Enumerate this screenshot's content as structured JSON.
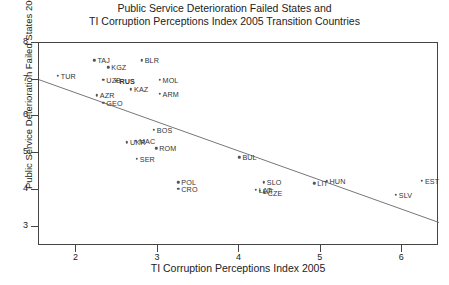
{
  "title": {
    "line1": "Public Service Deterioration Failed States  and",
    "line2": "TI Corruption Perceptions Index 2005 Transition Countries"
  },
  "axes": {
    "xlabel": "TI Corruption Perceptions Index 2005",
    "ylabel": "Public Service Deterioration Failed States 2006",
    "xticks": [
      "2",
      "3",
      "4",
      "5",
      "6"
    ],
    "yticks": [
      "8",
      "7",
      "6",
      "5",
      "4",
      "3"
    ]
  },
  "chart_data": {
    "type": "scatter",
    "title": "Public Service Deterioration Failed States  and TI Corruption Perceptions Index 2005 Transition Countries",
    "xlabel": "TI Corruption Perceptions Index 2005",
    "ylabel": "Public Service Deterioration Failed States 2006",
    "xlim": [
      1.54,
      6.45
    ],
    "ylim": [
      2.47,
      8.0
    ],
    "grid": false,
    "legend": null,
    "xticks": [
      2,
      3,
      4,
      5,
      6
    ],
    "yticks": [
      3,
      4,
      5,
      6,
      7,
      8
    ],
    "points": [
      {
        "label": "TUR",
        "x": 1.77,
        "y": 7.11,
        "label_pos": "right"
      },
      {
        "label": "TAJ",
        "x": 2.22,
        "y": 7.53,
        "label_pos": "right"
      },
      {
        "label": "KGZ",
        "x": 2.39,
        "y": 7.34,
        "label_pos": "right"
      },
      {
        "label": "BLR",
        "x": 2.8,
        "y": 7.53,
        "label_pos": "right"
      },
      {
        "label": "UZB",
        "x": 2.33,
        "y": 7.0,
        "label_pos": "right"
      },
      {
        "label": "RUS",
        "x": 2.49,
        "y": 6.97,
        "label_pos": "right",
        "bold": true
      },
      {
        "label": "MOL",
        "x": 3.02,
        "y": 7.0,
        "label_pos": "right"
      },
      {
        "label": "KAZ",
        "x": 2.67,
        "y": 6.74,
        "label_pos": "right"
      },
      {
        "label": "ARM",
        "x": 3.02,
        "y": 6.61,
        "label_pos": "right"
      },
      {
        "label": "AZR",
        "x": 2.25,
        "y": 6.58,
        "label_pos": "right"
      },
      {
        "label": "GEO",
        "x": 2.33,
        "y": 6.37,
        "label_pos": "right"
      },
      {
        "label": "BOS",
        "x": 2.95,
        "y": 5.63,
        "label_pos": "right"
      },
      {
        "label": "MAC",
        "x": 2.73,
        "y": 5.34,
        "label_pos": "right"
      },
      {
        "label": "UKR",
        "x": 2.62,
        "y": 5.29,
        "label_pos": "right"
      },
      {
        "label": "ROM",
        "x": 2.98,
        "y": 5.13,
        "label_pos": "right"
      },
      {
        "label": "SER",
        "x": 2.74,
        "y": 4.84,
        "label_pos": "right"
      },
      {
        "label": "BUL",
        "x": 4.0,
        "y": 4.89,
        "label_pos": "right"
      },
      {
        "label": "POL",
        "x": 3.25,
        "y": 4.21,
        "label_pos": "right"
      },
      {
        "label": "CRO",
        "x": 3.25,
        "y": 4.03,
        "label_pos": "right"
      },
      {
        "label": "SLO",
        "x": 4.3,
        "y": 4.21,
        "label_pos": "right"
      },
      {
        "label": "LAT",
        "x": 4.2,
        "y": 4.0,
        "label_pos": "right"
      },
      {
        "label": "LIT",
        "x": 4.25,
        "y": 3.97,
        "label_pos": "right"
      },
      {
        "label": "CZE",
        "x": 4.31,
        "y": 3.92,
        "label_pos": "right"
      },
      {
        "label": "LIT",
        "x": 4.92,
        "y": 4.18,
        "label_pos": "right"
      },
      {
        "label": "HUN",
        "x": 5.07,
        "y": 4.24,
        "label_pos": "right"
      },
      {
        "label": "EST",
        "x": 6.24,
        "y": 4.24,
        "label_pos": "right"
      },
      {
        "label": "SLV",
        "x": 5.92,
        "y": 3.87,
        "label_pos": "right"
      }
    ],
    "fit_line": {
      "type": "linear-regression",
      "x0": 1.54,
      "y0": 7.0,
      "x1": 6.45,
      "y1": 3.11
    }
  },
  "caption": ""
}
